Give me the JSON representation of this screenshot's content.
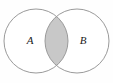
{
  "figure": {
    "kind": "venn-diagram",
    "background_color": "#fefefe",
    "stroke_color": "#9a9a9a",
    "stroke_width": 1,
    "intersection_fill": "#c8c8c8",
    "circle_fill": "#ffffff",
    "width": 113,
    "height": 83
  },
  "sets": [
    {
      "id": "A",
      "label": "A",
      "label_x": 30,
      "label_y": 41,
      "cx": 36,
      "cy": 41,
      "r": 32
    },
    {
      "id": "B",
      "label": "B",
      "label_x": 83,
      "label_y": 41,
      "cx": 77,
      "cy": 41,
      "r": 32
    }
  ],
  "intersection": {
    "id": "A-and-B",
    "shaded": true,
    "fill": "#c8c8c8",
    "label": ""
  }
}
